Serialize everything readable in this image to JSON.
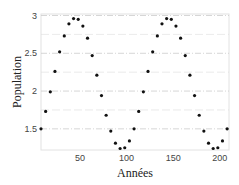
{
  "chart_data": {
    "type": "scatter",
    "title": "",
    "xlabel": "Années",
    "ylabel": "Population",
    "xlim": [
      8,
      210
    ],
    "ylim": [
      1.22,
      3.02
    ],
    "xticks": [
      50,
      100,
      150,
      200
    ],
    "yticks": [
      1.5,
      2,
      2.5,
      3
    ],
    "ytick_labels": [
      "1.5",
      "2",
      "2.5",
      "3"
    ],
    "xtick_labels": [
      "50",
      "100",
      "150",
      "200"
    ],
    "grid": true,
    "legend": null,
    "series": [
      {
        "name": "Population",
        "marker": "dot",
        "color": "#111111",
        "x": [
          8,
          13,
          18,
          23,
          28,
          33,
          38,
          43,
          48,
          53,
          58,
          63,
          68,
          73,
          78,
          83,
          88,
          93,
          98,
          103,
          108,
          113,
          118,
          123,
          128,
          133,
          138,
          143,
          148,
          153,
          158,
          163,
          168,
          173,
          178,
          183,
          188,
          193,
          198,
          203,
          208
        ],
        "y": [
          1.5,
          1.73,
          1.99,
          2.26,
          2.52,
          2.73,
          2.89,
          2.96,
          2.95,
          2.86,
          2.7,
          2.47,
          2.21,
          1.94,
          1.68,
          1.47,
          1.31,
          1.24,
          1.25,
          1.34,
          1.5,
          1.73,
          1.99,
          2.26,
          2.52,
          2.73,
          2.89,
          2.96,
          2.95,
          2.86,
          2.7,
          2.47,
          2.21,
          1.94,
          1.68,
          1.47,
          1.31,
          1.24,
          1.25,
          1.34,
          1.5
        ]
      }
    ]
  },
  "colors": {
    "frame": "#dddddd",
    "grid": "#cccccc",
    "marker": "#111111"
  }
}
